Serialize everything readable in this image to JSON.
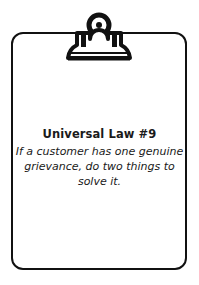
{
  "card": {
    "icon": "clipboard-icon",
    "title": "Universal Law #9",
    "body": "If a customer has one genuine grievance, do two things to solve it."
  },
  "colors": {
    "stroke": "#111111",
    "background": "#ffffff",
    "text": "#1a1a1a"
  }
}
